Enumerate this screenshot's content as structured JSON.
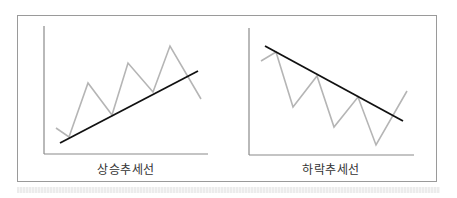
{
  "figure": {
    "panels": [
      {
        "id": "uptrend",
        "label": "상승추세선",
        "price_path": [
          [
            56,
            128
          ],
          [
            69,
            137
          ],
          [
            88,
            83
          ],
          [
            112,
            115
          ],
          [
            128,
            63
          ],
          [
            153,
            92
          ],
          [
            170,
            46
          ],
          [
            201,
            99
          ]
        ],
        "trend_line": [
          [
            60,
            143
          ],
          [
            198,
            71
          ]
        ]
      },
      {
        "id": "downtrend",
        "label": "하락추세선",
        "price_path": [
          [
            261,
            61
          ],
          [
            276,
            52
          ],
          [
            293,
            107
          ],
          [
            317,
            76
          ],
          [
            334,
            127
          ],
          [
            358,
            97
          ],
          [
            376,
            145
          ],
          [
            407,
            91
          ]
        ],
        "trend_line": [
          [
            265,
            46
          ],
          [
            403,
            121
          ]
        ]
      }
    ],
    "colors": {
      "frame": "#9a9a9a",
      "axis": "#8a8a8a",
      "price_path": "#b5b5b5",
      "trend_line": "#111111",
      "label": "#333333"
    }
  }
}
